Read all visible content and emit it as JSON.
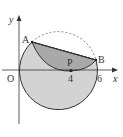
{
  "diagram": {
    "type": "geometry",
    "axes": {
      "x_label": "x",
      "y_label": "y",
      "origin_label": "O",
      "x_ticks": [
        "4",
        "6"
      ]
    },
    "points": {
      "A": "A",
      "B": "B",
      "P": "P"
    },
    "colors": {
      "circle_fill": "#d3d3d3",
      "segment_fill": "#a9a9a9",
      "stroke": "#333333",
      "dashed": "#666666"
    }
  }
}
